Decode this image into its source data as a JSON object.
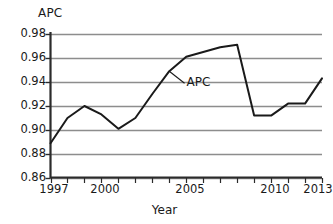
{
  "chart_data": {
    "type": "line",
    "title": "",
    "ylabel": "APC",
    "xlabel": "Year",
    "ylim": [
      0.86,
      0.98
    ],
    "xlim": [
      1997,
      2013
    ],
    "grid": true,
    "legend": "none",
    "annotations": [
      {
        "text": "APC",
        "x": 2004,
        "y": 0.949,
        "label_x": 2004.9,
        "label_y": 0.939
      }
    ],
    "ytick_labels": [
      "0.98",
      "0.96",
      "0.94",
      "0.92",
      "0.90",
      "0.88",
      "0.86"
    ],
    "ytick_values": [
      0.98,
      0.96,
      0.94,
      0.92,
      0.9,
      0.88,
      0.86
    ],
    "xtick_labels": [
      "1997",
      "2000",
      "2005",
      "2010",
      "2013"
    ],
    "xtick_values": [
      1997,
      2000,
      2005,
      2010,
      2013
    ],
    "xtick_minor_values": [
      1997,
      1998,
      1999,
      2000,
      2001,
      2002,
      2003,
      2004,
      2005,
      2006,
      2007,
      2008,
      2009,
      2010,
      2011,
      2012,
      2013
    ],
    "series": [
      {
        "name": "APC",
        "color": "#1a1a1a",
        "x": [
          1997,
          1998,
          1999,
          2000,
          2001,
          2002,
          2003,
          2004,
          2005,
          2006,
          2007,
          2008,
          2009,
          2010,
          2011,
          2012,
          2013
        ],
        "values": [
          0.889,
          0.91,
          0.92,
          0.913,
          0.901,
          0.91,
          0.93,
          0.949,
          0.961,
          0.965,
          0.969,
          0.971,
          0.912,
          0.912,
          0.922,
          0.922,
          0.943
        ]
      }
    ]
  },
  "axis": {
    "y_title": "APC",
    "x_title": "Year"
  }
}
